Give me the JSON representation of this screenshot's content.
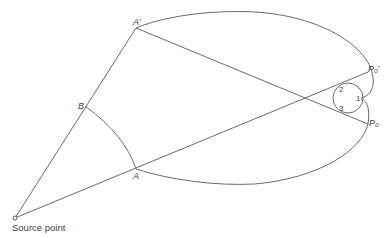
{
  "diagram": {
    "type": "ray-geometry",
    "labels": {
      "A_prime": "A′",
      "B": "B",
      "A": "A",
      "P0_prime": "P₀′",
      "P0": "P₀",
      "n1": "1",
      "n2": "2",
      "n3": "3",
      "source": "Source point"
    },
    "points": {
      "source": [
        15,
        218
      ],
      "B": [
        85,
        106
      ],
      "A_prime": [
        136,
        28
      ],
      "A": [
        136,
        169
      ],
      "P0_prime": [
        368,
        72
      ],
      "P0": [
        368,
        124
      ],
      "circle_center": [
        348,
        98
      ],
      "circle_radius": 15
    },
    "stroke_color": "#6a6a6a"
  }
}
